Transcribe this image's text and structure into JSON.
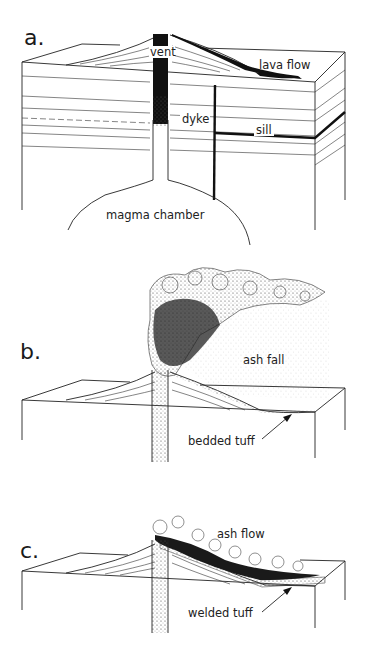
{
  "figure": {
    "panels": [
      {
        "letter": "a.",
        "labels": {
          "vent": "vent",
          "lava_flow": "lava flow",
          "dyke": "dyke",
          "sill": "sill",
          "magma_chamber": "magma chamber"
        }
      },
      {
        "letter": "b.",
        "labels": {
          "ash_fall": "ash fall",
          "bedded_tuff": "bedded tuff"
        }
      },
      {
        "letter": "c.",
        "labels": {
          "ash_flow": "ash flow",
          "welded_tuff": "welded tuff"
        }
      }
    ],
    "colors": {
      "ink": "#222222",
      "background": "#ffffff"
    }
  }
}
